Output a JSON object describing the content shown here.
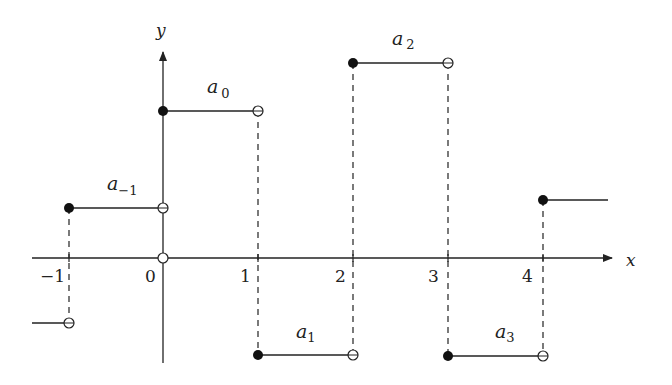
{
  "figure": {
    "axes": {
      "x_label": "x",
      "y_label": "y",
      "x_ticks": [
        "−1",
        "0",
        "1",
        "2",
        "3",
        "4"
      ]
    },
    "segments": [
      {
        "name": "a_minus2_tail",
        "label_base": "",
        "label_sub": "",
        "x_start": -1.5,
        "x_end": -1,
        "level": "low-negative"
      },
      {
        "name": "a_minus1",
        "label_base": "a",
        "label_sub": "−1",
        "x_start": -1,
        "x_end": 0,
        "level": "positive-small"
      },
      {
        "name": "a0",
        "label_base": "a",
        "label_sub": "0",
        "x_start": 0,
        "x_end": 1,
        "level": "positive-large"
      },
      {
        "name": "a1",
        "label_base": "a",
        "label_sub": "1",
        "x_start": 1,
        "x_end": 2,
        "level": "negative"
      },
      {
        "name": "a2",
        "label_base": "a",
        "label_sub": "2",
        "x_start": 2,
        "x_end": 3,
        "level": "positive-max"
      },
      {
        "name": "a3",
        "label_base": "a",
        "label_sub": "3",
        "x_start": 3,
        "x_end": 4,
        "level": "negative"
      },
      {
        "name": "a4_tail",
        "label_base": "",
        "label_sub": "",
        "x_start": 4,
        "x_end": 4.7,
        "level": "positive-small"
      }
    ],
    "colors": {
      "stroke": "#222222",
      "background": "#ffffff"
    }
  }
}
